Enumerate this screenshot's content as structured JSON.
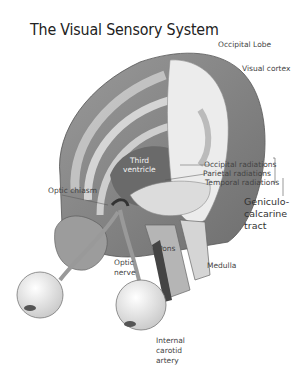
{
  "title": "The Visual Sensory System",
  "labels": {
    "occipital_lobe": "Occipital Lobe",
    "visual_cortex": "Visual cortex",
    "third_ventricle_1": "Third",
    "third_ventricle_2": "ventricle",
    "optic_chiasm": "Optic chiasm",
    "occipital_radiations": "Occipital radiations",
    "parietal_radiations": "Parietal radiations",
    "temporal_radiations": "Temporal radiations",
    "geniculo_1": "Geniculo-",
    "geniculo_2": "calcarine",
    "geniculo_3": "tract",
    "pons": "Pons",
    "optic_nerve_1": "Optic",
    "optic_nerve_2": "nerve",
    "medulla": "Medulla",
    "carotid_1": "Internal",
    "carotid_2": "carotid",
    "carotid_3": "artery"
  },
  "colors": {
    "background": "#ffffff",
    "cortex_dark": "#8a8a8a",
    "cortex_mid": "#a8a8a8",
    "white_matter": "#e6e6e6",
    "text": "#444444"
  }
}
